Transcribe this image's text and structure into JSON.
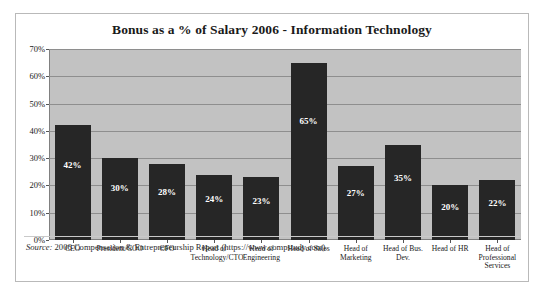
{
  "figure": {
    "source_lead": "Source:",
    "source_text": " 2006 Compensation & Entrepreneurship Report (https://www.compstudy.com)."
  },
  "chart_data": {
    "type": "bar",
    "title": "Bonus as a % of Salary 2006 - Information Technology",
    "xlabel": "",
    "ylabel": "",
    "ylim": [
      0,
      70
    ],
    "grid": true,
    "legend": "none",
    "categories": [
      "CEO",
      "President/COO",
      "CFO",
      "Head of Technology/CTO",
      "Head of Engineering",
      "Head of Sales",
      "Head of Marketing",
      "Head of Bus. Dev.",
      "Head of HR",
      "Head of Professional Services"
    ],
    "values": [
      42,
      30,
      28,
      24,
      23,
      65,
      27,
      35,
      20,
      22
    ],
    "value_labels": [
      "42%",
      "30%",
      "28%",
      "24%",
      "23%",
      "65%",
      "27%",
      "35%",
      "20%",
      "22%"
    ],
    "ytick_values": [
      0,
      10,
      20,
      30,
      40,
      50,
      60,
      70
    ],
    "ytick_labels": [
      "0%",
      "10%",
      "20%",
      "30%",
      "40%",
      "50%",
      "60%",
      "70%"
    ],
    "colors": {
      "bar": "#262626",
      "plot_background": "#c2c2c2",
      "gridline": "#8e8e8e",
      "value_label": "#ffffff"
    }
  }
}
